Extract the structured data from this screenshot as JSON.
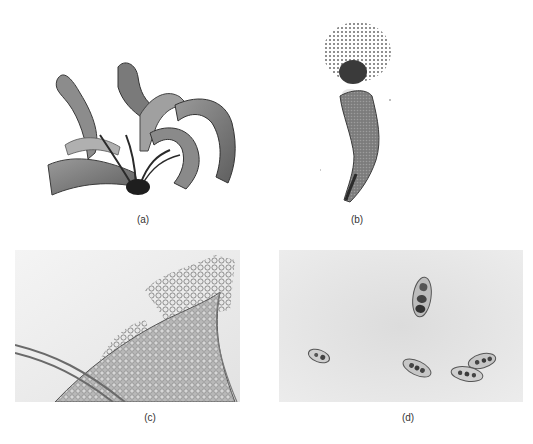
{
  "figure": {
    "panels": [
      {
        "id": "a",
        "label": "(a)",
        "description": "Branched ribbon-like thallus with dark holdfast"
      },
      {
        "id": "b",
        "label": "(b)",
        "description": "Curved banded filament releasing a granular cluster at its tip"
      },
      {
        "id": "c",
        "label": "(c)",
        "description": "Edge of a cell mass with spherical cells, crossed by a tubular filament"
      },
      {
        "id": "d",
        "label": "(d)",
        "description": "Scattered oval multicellular spores on pale background"
      }
    ]
  }
}
